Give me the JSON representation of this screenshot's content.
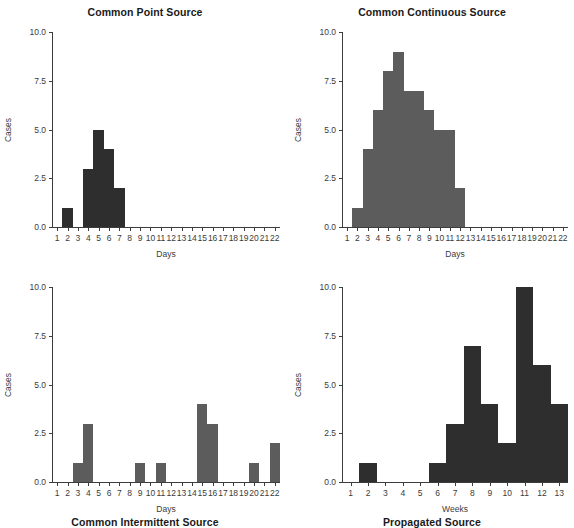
{
  "figure": {
    "background": "#ffffff",
    "width": 574,
    "height": 506
  },
  "chart_data": [
    {
      "id": "common-point-source",
      "type": "bar",
      "title": "Common Point Source",
      "xlabel": "Days",
      "ylabel": "Cases",
      "bar_color": "#2e2e2e",
      "grid": false,
      "legend": "none",
      "xlim": [
        0.5,
        22.5
      ],
      "ylim": [
        0,
        10
      ],
      "ytick_labels": [
        "0.0",
        "2.5",
        "5.0",
        "7.5",
        "10.0"
      ],
      "ytick_values": [
        0,
        2.5,
        5,
        7.5,
        10
      ],
      "categories": [
        1,
        2,
        3,
        4,
        5,
        6,
        7,
        8,
        9,
        10,
        11,
        12,
        13,
        14,
        15,
        16,
        17,
        18,
        19,
        20,
        21,
        22
      ],
      "xtick_labels": [
        "1",
        "2",
        "3",
        "4",
        "5",
        "6",
        "7",
        "8",
        "9",
        "10",
        "11",
        "12",
        "13",
        "14",
        "15",
        "16",
        "17",
        "18",
        "19",
        "20",
        "21",
        "22"
      ],
      "values": [
        0,
        1,
        0,
        3,
        5,
        4,
        2,
        0,
        0,
        0,
        0,
        0,
        0,
        0,
        0,
        0,
        0,
        0,
        0,
        0,
        0,
        0
      ]
    },
    {
      "id": "common-continuous-source",
      "type": "bar",
      "title": "Common Continuous Source",
      "xlabel": "Days",
      "ylabel": "Cases",
      "bar_color": "#5c5c5c",
      "grid": false,
      "legend": "none",
      "xlim": [
        0.5,
        22.5
      ],
      "ylim": [
        0,
        10
      ],
      "ytick_labels": [
        "0.0",
        "2.5",
        "5.0",
        "7.5",
        "10.0"
      ],
      "ytick_values": [
        0,
        2.5,
        5,
        7.5,
        10
      ],
      "categories": [
        1,
        2,
        3,
        4,
        5,
        6,
        7,
        8,
        9,
        10,
        11,
        12,
        13,
        14,
        15,
        16,
        17,
        18,
        19,
        20,
        21,
        22
      ],
      "xtick_labels": [
        "1",
        "2",
        "3",
        "4",
        "5",
        "6",
        "7",
        "8",
        "9",
        "10",
        "11",
        "12",
        "13",
        "14",
        "15",
        "16",
        "17",
        "18",
        "19",
        "20",
        "21",
        "22"
      ],
      "values": [
        0,
        1,
        4,
        6,
        8,
        9,
        7,
        7,
        6,
        5,
        5,
        2,
        0,
        0,
        0,
        0,
        0,
        0,
        0,
        0,
        0,
        0
      ]
    },
    {
      "id": "common-intermittent-source",
      "type": "bar",
      "title": "Common Intermittent Source",
      "xlabel": "Days",
      "ylabel": "Cases",
      "bar_color": "#5c5c5c",
      "grid": false,
      "legend": "none",
      "xlim": [
        0.5,
        22.5
      ],
      "ylim": [
        0,
        10
      ],
      "ytick_labels": [
        "0.0",
        "2.5",
        "5.0",
        "7.5",
        "10.0"
      ],
      "ytick_values": [
        0,
        2.5,
        5,
        7.5,
        10
      ],
      "categories": [
        1,
        2,
        3,
        4,
        5,
        6,
        7,
        8,
        9,
        10,
        11,
        12,
        13,
        14,
        15,
        16,
        17,
        18,
        19,
        20,
        21,
        22
      ],
      "xtick_labels": [
        "1",
        "2",
        "3",
        "4",
        "5",
        "6",
        "7",
        "8",
        "9",
        "10",
        "11",
        "12",
        "13",
        "14",
        "15",
        "16",
        "17",
        "18",
        "19",
        "20",
        "21",
        "22"
      ],
      "values": [
        0,
        0,
        1,
        3,
        0,
        0,
        0,
        0,
        1,
        0,
        1,
        0,
        0,
        0,
        4,
        3,
        0,
        0,
        0,
        1,
        0,
        2
      ]
    },
    {
      "id": "propagated-source",
      "type": "bar",
      "title": "Propagated Source",
      "xlabel": "Weeks",
      "ylabel": "Cases",
      "bar_color": "#2e2e2e",
      "grid": false,
      "legend": "none",
      "xlim": [
        0.5,
        13.5
      ],
      "ylim": [
        0,
        10
      ],
      "ytick_labels": [
        "0.0",
        "2.5",
        "5.0",
        "7.5",
        "10.0"
      ],
      "ytick_values": [
        0,
        2.5,
        5,
        7.5,
        10
      ],
      "categories": [
        1,
        2,
        3,
        4,
        5,
        6,
        7,
        8,
        9,
        10,
        11,
        12,
        13
      ],
      "xtick_labels": [
        "1",
        "2",
        "3",
        "4",
        "5",
        "6",
        "7",
        "8",
        "9",
        "10",
        "11",
        "12",
        "13"
      ],
      "values": [
        0,
        1,
        0,
        0,
        0,
        1,
        3,
        7,
        4,
        2,
        10,
        6,
        4
      ]
    }
  ]
}
